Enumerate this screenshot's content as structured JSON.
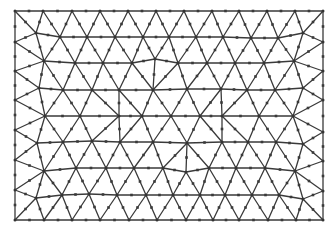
{
  "diagram": {
    "type": "finite-element-mesh",
    "element_type": "quadratic-triangle",
    "stroke_color": "#3a3a3a",
    "node_color": "#333333",
    "background": "#ffffff",
    "bounds": {
      "x_min": 15,
      "x_max": 323,
      "y_min": 11,
      "y_max": 220
    },
    "boundary_nodes": {
      "top": [
        [
          15,
          11
        ],
        [
          43,
          11
        ],
        [
          72,
          11
        ],
        [
          100,
          11
        ],
        [
          128,
          11
        ],
        [
          156,
          11
        ],
        [
          184,
          11
        ],
        [
          212,
          11
        ],
        [
          239,
          11
        ],
        [
          267,
          11
        ],
        [
          295,
          11
        ],
        [
          323,
          11
        ]
      ],
      "bottom": [
        [
          15,
          220
        ],
        [
          44,
          220
        ],
        [
          72,
          220
        ],
        [
          100,
          220
        ],
        [
          129,
          220
        ],
        [
          157,
          220
        ],
        [
          186,
          220
        ],
        [
          213,
          220
        ],
        [
          239,
          220
        ],
        [
          268,
          220
        ],
        [
          296,
          220
        ],
        [
          323,
          220
        ]
      ],
      "left": [
        [
          15,
          42
        ],
        [
          15,
          71
        ],
        [
          15,
          100
        ],
        [
          15,
          130
        ],
        [
          15,
          160
        ],
        [
          15,
          190
        ]
      ],
      "right": [
        [
          323,
          42
        ],
        [
          323,
          71
        ],
        [
          323,
          100
        ],
        [
          323,
          132
        ],
        [
          323,
          161
        ],
        [
          323,
          191
        ]
      ]
    },
    "interior_rows": [
      [
        [
          36,
          33
        ],
        [
          60,
          37
        ],
        [
          87,
          37
        ],
        [
          115,
          37
        ],
        [
          143,
          37
        ],
        [
          169,
          37
        ],
        [
          196,
          37
        ],
        [
          223,
          37
        ],
        [
          251,
          38
        ],
        [
          278,
          38
        ],
        [
          303,
          33
        ]
      ],
      [
        [
          44,
          61
        ],
        [
          75,
          63
        ],
        [
          103,
          63
        ],
        [
          132,
          63
        ],
        [
          155,
          59
        ],
        [
          178,
          63
        ],
        [
          207,
          63
        ],
        [
          235,
          63
        ],
        [
          264,
          63
        ],
        [
          294,
          61
        ]
      ],
      [
        [
          39,
          88
        ],
        [
          63,
          90
        ],
        [
          92,
          90
        ],
        [
          119,
          90
        ],
        [
          153,
          90
        ],
        [
          187,
          89
        ],
        [
          221,
          89
        ],
        [
          247,
          90
        ],
        [
          275,
          90
        ],
        [
          303,
          88
        ]
      ],
      [
        [
          45,
          116
        ],
        [
          80,
          116
        ],
        [
          119,
          116
        ],
        [
          142,
          116
        ],
        [
          171,
          116
        ],
        [
          200,
          116
        ],
        [
          222,
          116
        ],
        [
          259,
          116
        ],
        [
          293,
          116
        ]
      ],
      [
        [
          37,
          143
        ],
        [
          63,
          142
        ],
        [
          92,
          141
        ],
        [
          120,
          142
        ],
        [
          153,
          142
        ],
        [
          187,
          143
        ],
        [
          222,
          142
        ],
        [
          248,
          142
        ],
        [
          276,
          142
        ],
        [
          303,
          144
        ]
      ],
      [
        [
          44,
          171
        ],
        [
          76,
          168
        ],
        [
          106,
          168
        ],
        [
          134,
          168
        ],
        [
          163,
          168
        ],
        [
          186,
          172
        ],
        [
          209,
          168
        ],
        [
          236,
          168
        ],
        [
          265,
          168
        ],
        [
          295,
          171
        ]
      ],
      [
        [
          36,
          198
        ],
        [
          62,
          195
        ],
        [
          89,
          194
        ],
        [
          117,
          195
        ],
        [
          146,
          195
        ],
        [
          173,
          195
        ],
        [
          200,
          195
        ],
        [
          225,
          195
        ],
        [
          252,
          195
        ],
        [
          279,
          195
        ],
        [
          303,
          199
        ]
      ]
    ]
  }
}
